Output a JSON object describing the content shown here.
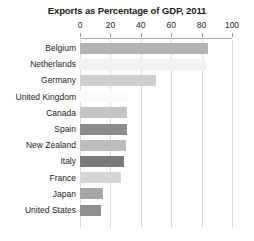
{
  "chart_data": {
    "type": "bar",
    "title": "Exports as Percentage of GDP, 2011",
    "xlabel": "",
    "ylabel": "",
    "orientation": "horizontal",
    "xlim": [
      0,
      100
    ],
    "grid": true,
    "legend": null,
    "ticks": [
      "0",
      "20",
      "40",
      "60",
      "80",
      "100"
    ],
    "tick_values": [
      0,
      20,
      40,
      60,
      80,
      100
    ],
    "categories": [
      "Belgium",
      "Netherlands",
      "Germany",
      "United Kingdom",
      "Canada",
      "Spain",
      "New Zealand",
      "Italy",
      "France",
      "Japan",
      "United States"
    ],
    "values": [
      84,
      83,
      50,
      32,
      31,
      31,
      30,
      29,
      27,
      15,
      14
    ],
    "bar_colors": [
      "#b3b3b3",
      "#f2f2f2",
      "#cfcfcf",
      "#fafafa",
      "#c4c4c4",
      "#8c8c8c",
      "#bdbdbd",
      "#7a7a7a",
      "#d6d6d6",
      "#a8a8a8",
      "#8f8f8f"
    ]
  }
}
